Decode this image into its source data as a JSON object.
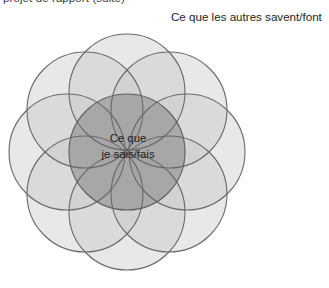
{
  "page": {
    "cropped_header_text": "projet de rapport (suite)",
    "background_color": "#ffffff"
  },
  "diagram": {
    "type": "venn",
    "outer_label": "Ce que les autres savent/font",
    "center_label_line1": "Ce que",
    "center_label_line2": "je sais/fais",
    "center": {
      "cx": 127,
      "cy": 152,
      "r": 58
    },
    "outer_circle_count": 8,
    "outer_radius": 58,
    "outer_ring_distance": 60,
    "outer_circles": [
      {
        "name": "circle-n",
        "angle_deg": 270,
        "cx": 127,
        "cy": 92
      },
      {
        "name": "circle-ne",
        "angle_deg": 315,
        "cx": 169,
        "cy": 110
      },
      {
        "name": "circle-e",
        "angle_deg": 0,
        "cx": 187,
        "cy": 152
      },
      {
        "name": "circle-se",
        "angle_deg": 45,
        "cx": 169,
        "cy": 194
      },
      {
        "name": "circle-s",
        "angle_deg": 90,
        "cx": 127,
        "cy": 212
      },
      {
        "name": "circle-sw",
        "angle_deg": 135,
        "cx": 85,
        "cy": 194
      },
      {
        "name": "circle-w",
        "angle_deg": 180,
        "cx": 67,
        "cy": 152
      },
      {
        "name": "circle-nw",
        "angle_deg": 225,
        "cx": 85,
        "cy": 110
      }
    ],
    "colors": {
      "circle_fill": "#cfcfcf",
      "circle_fill_opacity": "0.42",
      "circle_stroke": "#6e6e6e",
      "center_fill": "#8f8f8f",
      "text_color": "#231f20"
    }
  }
}
